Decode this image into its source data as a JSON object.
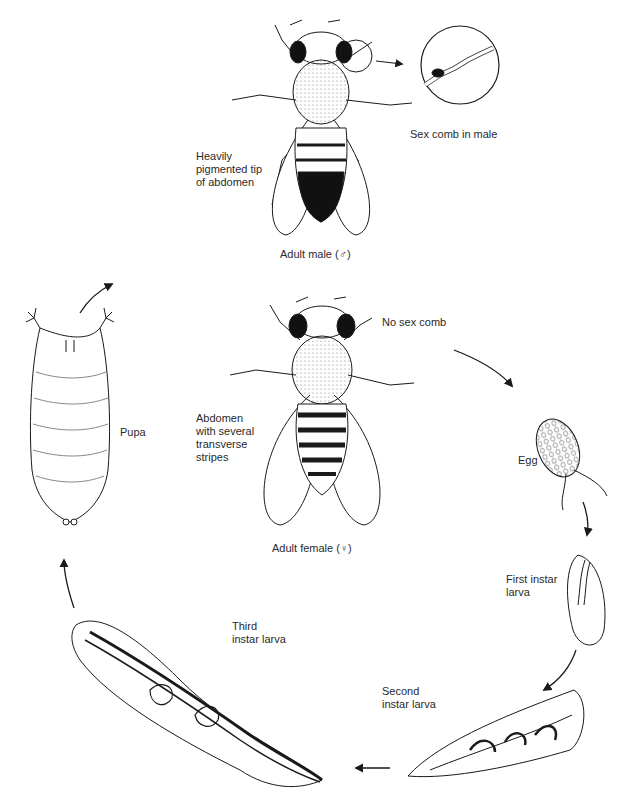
{
  "diagram": {
    "stages": [
      {
        "id": "adult-male",
        "label": "Adult male (♂)"
      },
      {
        "id": "adult-female",
        "label": "Adult female (♀)"
      },
      {
        "id": "egg",
        "label": "Egg"
      },
      {
        "id": "first-instar",
        "label": "First instar\nlarva"
      },
      {
        "id": "second-instar",
        "label": "Second\ninstar larva"
      },
      {
        "id": "third-instar",
        "label": "Third\ninstar larva"
      },
      {
        "id": "pupa",
        "label": "Pupa"
      }
    ],
    "annotations": {
      "male_abdomen": "Heavily\npigmented tip\nof abdomen",
      "sex_comb_male": "Sex comb in male",
      "female_no_comb": "No sex comb",
      "female_abdomen": "Abdomen\nwith several\ntransverse\nstripes"
    },
    "colors": {
      "ink": "#1a1a1a",
      "background": "#ffffff"
    }
  }
}
